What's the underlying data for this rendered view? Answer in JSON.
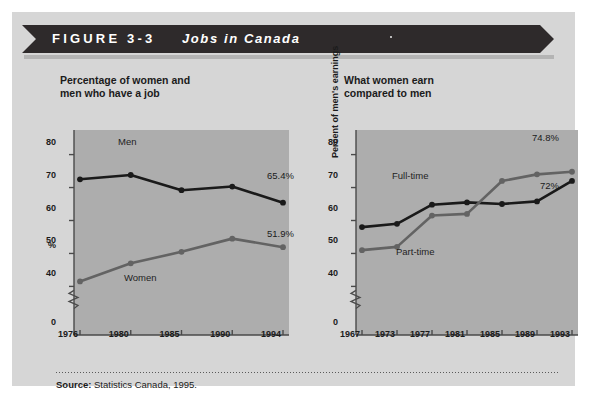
{
  "banner": {
    "figure_label": "FIGURE 3-3",
    "figure_title": "Jobs in Canada",
    "bar_color": "#2e2a2b",
    "text_color": "#ffffff"
  },
  "source": {
    "prefix": "Source:",
    "text": "Statistics Canada, 1995."
  },
  "panel": {
    "background": "#d6d6d6",
    "plot_background": "#adadad"
  },
  "chart_data": [
    {
      "type": "line",
      "id": "left",
      "title": "Percentage of women and\nmen who have a job",
      "xlabel": "",
      "ylabel": "%",
      "ylim": [
        38,
        82
      ],
      "yticks": [
        0,
        40,
        50,
        60,
        70,
        80
      ],
      "ytick_labels": [
        "0",
        "40",
        "50",
        "60",
        "70",
        "80"
      ],
      "axis_break": true,
      "grid": false,
      "legend": "inline-annotations",
      "categories": [
        "1976",
        "1980",
        "1985",
        "1990",
        "1994"
      ],
      "x": [
        1976,
        1980,
        1985,
        1990,
        1994
      ],
      "series": [
        {
          "name": "Men",
          "color": "#1a1a1a",
          "label_position": "above-line",
          "values": [
            72.5,
            73.8,
            69.2,
            70.3,
            65.4
          ],
          "end_label": "65.4%"
        },
        {
          "name": "Women",
          "color": "#636363",
          "label_position": "below-line",
          "values": [
            41.5,
            47.0,
            50.5,
            54.5,
            51.9
          ],
          "end_label": "51.9%"
        }
      ]
    },
    {
      "type": "line",
      "id": "right",
      "title": "What women earn\ncompared to men",
      "xlabel": "",
      "ylabel": "Percent of men's earnings",
      "ylim": [
        38,
        82
      ],
      "yticks": [
        0,
        40,
        50,
        60,
        70,
        80
      ],
      "ytick_labels": [
        "0",
        "40",
        "50",
        "60",
        "70",
        "80"
      ],
      "axis_break": true,
      "grid": false,
      "legend": "inline-annotations",
      "categories": [
        "1967",
        "1973",
        "1977",
        "1981",
        "1985",
        "1989",
        "1993"
      ],
      "x": [
        1967,
        1973,
        1977,
        1981,
        1985,
        1989,
        1993
      ],
      "series": [
        {
          "name": "Full-time",
          "color": "#1a1a1a",
          "label_position": "above-line",
          "values": [
            58.0,
            59.0,
            64.8,
            65.5,
            65.0,
            65.8,
            72.0
          ],
          "end_label": "72%"
        },
        {
          "name": "Part-time",
          "color": "#636363",
          "label_position": "below-line",
          "values": [
            51.0,
            52.0,
            61.5,
            62.0,
            72.0,
            74.0,
            74.8
          ],
          "end_label": "74.8%"
        }
      ]
    }
  ]
}
